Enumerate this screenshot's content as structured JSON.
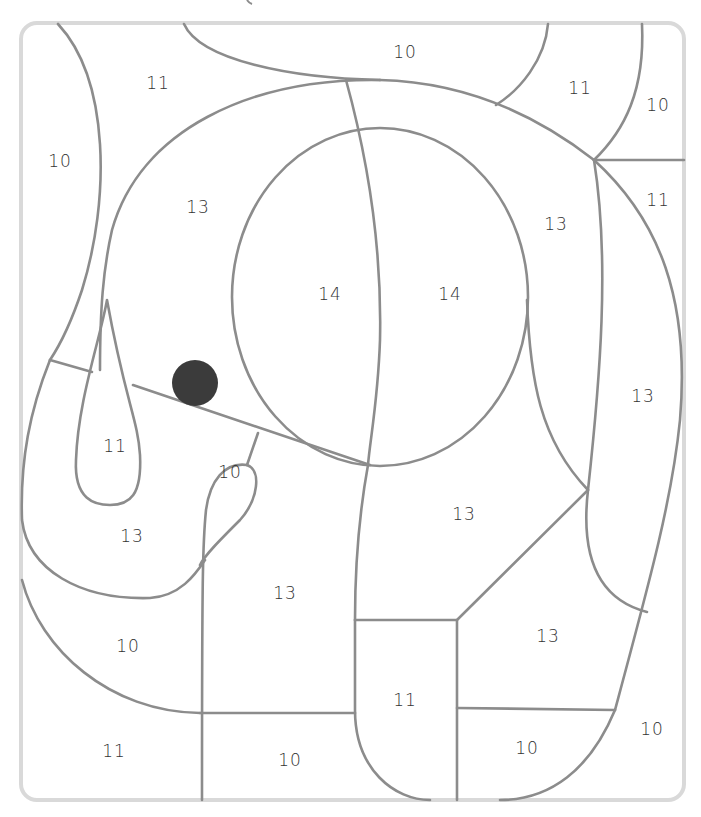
{
  "puzzle": {
    "type": "color-by-number",
    "subject": "elephant",
    "line_color": "#8c8c8c",
    "frame_color": "#d9d9d9",
    "eye_color": "#3b3b3b",
    "number_color": "#333333"
  },
  "regions": [
    {
      "id": "r1",
      "label": "11",
      "x": 158,
      "y": 84
    },
    {
      "id": "r2",
      "label": "10",
      "x": 405,
      "y": 53
    },
    {
      "id": "r3",
      "label": "11",
      "x": 580,
      "y": 89
    },
    {
      "id": "r4",
      "label": "10",
      "x": 658,
      "y": 106
    },
    {
      "id": "r5",
      "label": "10",
      "x": 60,
      "y": 162
    },
    {
      "id": "r6",
      "label": "13",
      "x": 198,
      "y": 208
    },
    {
      "id": "r7",
      "label": "13",
      "x": 556,
      "y": 225
    },
    {
      "id": "r8",
      "label": "11",
      "x": 658,
      "y": 201
    },
    {
      "id": "r9",
      "label": "14",
      "x": 330,
      "y": 295
    },
    {
      "id": "r10",
      "label": "14",
      "x": 450,
      "y": 295
    },
    {
      "id": "r11",
      "label": "13",
      "x": 643,
      "y": 397
    },
    {
      "id": "r12",
      "label": "11",
      "x": 115,
      "y": 447
    },
    {
      "id": "r13",
      "label": "10",
      "x": 230,
      "y": 473
    },
    {
      "id": "r14",
      "label": "13",
      "x": 132,
      "y": 537
    },
    {
      "id": "r15",
      "label": "13",
      "x": 464,
      "y": 515
    },
    {
      "id": "r16",
      "label": "13",
      "x": 285,
      "y": 594
    },
    {
      "id": "r17",
      "label": "13",
      "x": 548,
      "y": 637
    },
    {
      "id": "r18",
      "label": "10",
      "x": 128,
      "y": 647
    },
    {
      "id": "r19",
      "label": "11",
      "x": 405,
      "y": 701
    },
    {
      "id": "r20",
      "label": "10",
      "x": 652,
      "y": 730
    },
    {
      "id": "r21",
      "label": "11",
      "x": 114,
      "y": 752
    },
    {
      "id": "r22",
      "label": "10",
      "x": 290,
      "y": 761
    },
    {
      "id": "r23",
      "label": "10",
      "x": 527,
      "y": 749
    }
  ]
}
